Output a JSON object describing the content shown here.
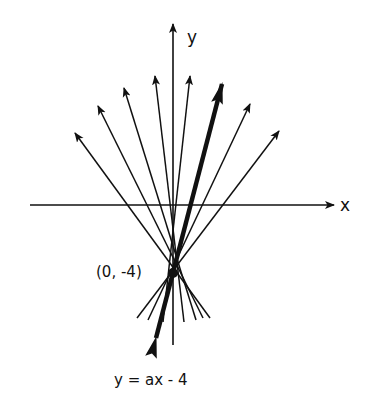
{
  "diagram": {
    "axis_labels": {
      "x": "x",
      "y": "y"
    },
    "point_label": "(0, -4)",
    "equation_label": "y = ax - 4",
    "colors": {
      "ink": "#111111",
      "background": "#ffffff"
    },
    "center": [
      173,
      273
    ],
    "thin_lines": [
      {
        "tip": [
          75,
          133
        ],
        "tail": [
          210,
          318
        ]
      },
      {
        "tip": [
          98,
          106
        ],
        "tail": [
          203,
          318
        ]
      },
      {
        "tip": [
          124,
          88
        ],
        "tail": [
          196,
          320
        ]
      },
      {
        "tip": [
          155,
          76
        ],
        "tail": [
          184,
          322
        ]
      },
      {
        "tip": [
          190,
          76
        ],
        "tail": [
          163,
          322
        ]
      },
      {
        "tip": [
          250,
          104
        ],
        "tail": [
          148,
          320
        ]
      },
      {
        "tip": [
          279,
          131
        ],
        "tail": [
          137,
          318
        ]
      }
    ],
    "bold_line": {
      "tip": [
        228,
        68
      ],
      "tail": [
        150,
        355
      ]
    }
  }
}
